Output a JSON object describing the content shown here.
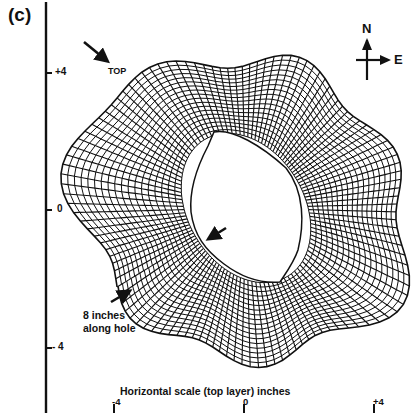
{
  "figure": {
    "panel_label": "(c)",
    "y_axis": {
      "ticks": [
        {
          "label": "+4",
          "y": 73
        },
        {
          "label": "0",
          "y": 210
        },
        {
          "label": "- 4",
          "y": 348
        }
      ]
    },
    "x_axis": {
      "title": "Horizontal scale (top layer) inches",
      "ticks": [
        {
          "label": "-4",
          "x": 114
        },
        {
          "label": "0",
          "x": 244
        },
        {
          "label": "+4",
          "x": 374
        }
      ]
    },
    "compass": {
      "north": "N",
      "east": "E"
    },
    "annotations": {
      "top_marker": "TOP",
      "along_hole_line1": "8 inches",
      "along_hole_line2": "along hole"
    },
    "colors": {
      "ink": "#111111",
      "paper": "#ffffff"
    }
  }
}
